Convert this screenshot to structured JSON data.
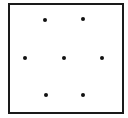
{
  "figure": {
    "shape": "square",
    "stroke_color": "#1a1a1a",
    "dot_color": "#111111",
    "dot_count": 7,
    "dots": [
      {
        "id": "top-left",
        "x": 45,
        "y": 20
      },
      {
        "id": "top-right",
        "x": 83,
        "y": 19
      },
      {
        "id": "middle-left",
        "x": 25,
        "y": 58
      },
      {
        "id": "center",
        "x": 64,
        "y": 58
      },
      {
        "id": "middle-right",
        "x": 102,
        "y": 58
      },
      {
        "id": "bottom-left",
        "x": 46,
        "y": 95
      },
      {
        "id": "bottom-right",
        "x": 83,
        "y": 95
      }
    ]
  }
}
